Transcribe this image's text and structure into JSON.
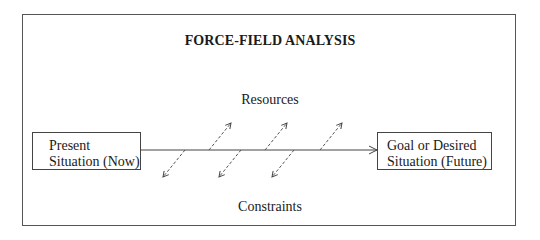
{
  "title": "FORCE-FIELD ANALYSIS",
  "top_label": "Resources",
  "bottom_label": "Constraints",
  "present_box": {
    "line1": "Present",
    "line2": "Situation (Now)"
  },
  "goal_box": {
    "line1": "Goal or Desired",
    "line2": "Situation (Future)"
  },
  "colors": {
    "line": "#444444",
    "frame": "#555555",
    "text": "#1a1a1a"
  },
  "main_arrow": {
    "x1": 141,
    "y": 150,
    "x2": 377
  },
  "resource_arrows": [
    {
      "x1": 209,
      "y1": 150,
      "x2": 231,
      "y2": 123
    },
    {
      "x1": 265,
      "y1": 150,
      "x2": 287,
      "y2": 123
    },
    {
      "x1": 320,
      "y1": 150,
      "x2": 342,
      "y2": 123
    }
  ],
  "constraint_arrows": [
    {
      "x1": 185,
      "y1": 150,
      "x2": 163,
      "y2": 177
    },
    {
      "x1": 241,
      "y1": 150,
      "x2": 219,
      "y2": 177
    },
    {
      "x1": 294,
      "y1": 150,
      "x2": 272,
      "y2": 177
    }
  ]
}
